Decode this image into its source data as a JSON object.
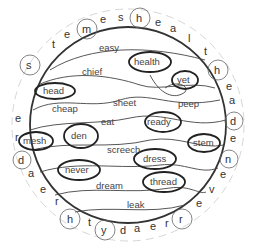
{
  "puzzle": {
    "ring_letters": [
      "d",
      "r",
      "e",
      "s",
      "t",
      "e",
      "m",
      "e",
      "s",
      "h",
      "e",
      "a",
      "l",
      "t",
      "h",
      "e",
      "a",
      "d",
      "e",
      "n",
      "e",
      "v",
      "e",
      "r",
      "r",
      "e",
      "a",
      "d",
      "y",
      "t",
      "h",
      "r",
      "e",
      "a"
    ],
    "circled_ring_letters": [
      "d",
      "s",
      "m",
      "h",
      "h",
      "d",
      "n",
      "r",
      "y",
      "t"
    ],
    "words": [
      {
        "text": "easy",
        "circled": false
      },
      {
        "text": "health",
        "circled": true
      },
      {
        "text": "chief",
        "circled": false
      },
      {
        "text": "yet",
        "circled": true
      },
      {
        "text": "head",
        "circled": true
      },
      {
        "text": "cheap",
        "circled": false
      },
      {
        "text": "sheet",
        "circled": false
      },
      {
        "text": "peep",
        "circled": false
      },
      {
        "text": "eat",
        "circled": false
      },
      {
        "text": "ready",
        "circled": true
      },
      {
        "text": "mesh",
        "circled": true
      },
      {
        "text": "den",
        "circled": true
      },
      {
        "text": "stem",
        "circled": true
      },
      {
        "text": "screech",
        "circled": false
      },
      {
        "text": "dress",
        "circled": true
      },
      {
        "text": "never",
        "circled": true
      },
      {
        "text": "dream",
        "circled": false
      },
      {
        "text": "thread",
        "circled": true
      },
      {
        "text": "leak",
        "circled": false
      }
    ]
  }
}
